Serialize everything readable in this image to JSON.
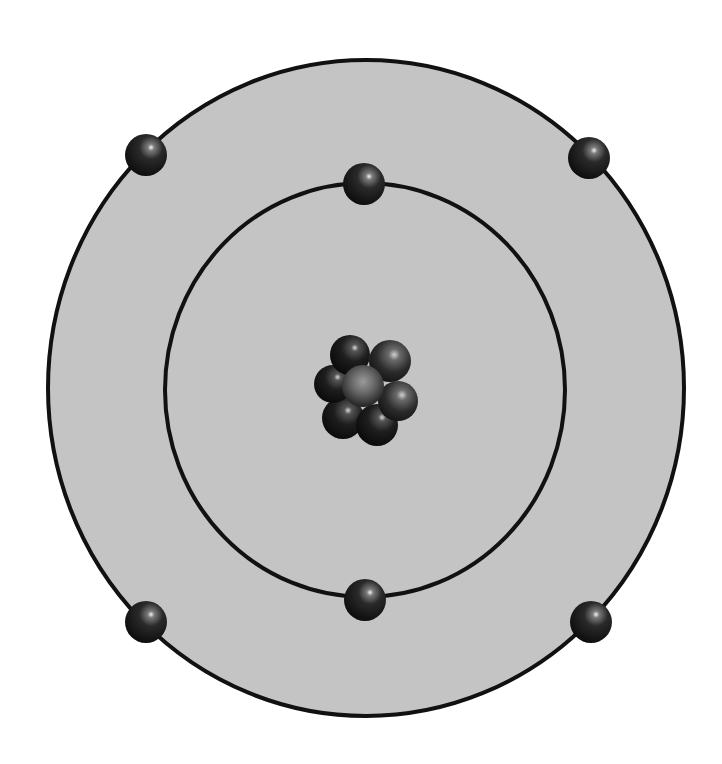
{
  "diagram": {
    "type": "atom-bohr-model",
    "colors": {
      "background": "#ffffff",
      "atom_fill": "#c4c4c4",
      "orbit_stroke": "#111111",
      "particle_dark": "#121212",
      "particle_mid": "#3a3a3a",
      "particle_highlight": "#e8e8e8"
    },
    "outer_boundary": {
      "cx": 366,
      "cy": 388,
      "rx": 318,
      "ry": 328,
      "stroke_width": 4
    },
    "orbits": [
      {
        "name": "inner-orbit",
        "cx": 365,
        "cy": 390,
        "rx": 200,
        "ry": 207,
        "stroke_width": 4
      }
    ],
    "electrons": [
      {
        "name": "electron-inner-top",
        "cx": 364,
        "cy": 184,
        "r": 21
      },
      {
        "name": "electron-inner-bottom",
        "cx": 365,
        "cy": 600,
        "r": 21
      },
      {
        "name": "electron-outer-top-left",
        "cx": 146,
        "cy": 155,
        "r": 21
      },
      {
        "name": "electron-outer-top-right",
        "cx": 589,
        "cy": 158,
        "r": 21
      },
      {
        "name": "electron-outer-bottom-left",
        "cx": 146,
        "cy": 622,
        "r": 21
      },
      {
        "name": "electron-outer-bottom-right",
        "cx": 591,
        "cy": 622,
        "r": 21
      }
    ],
    "nucleus": {
      "particle_count": 7,
      "particles": [
        {
          "cx": 343,
          "cy": 418,
          "r": 21,
          "tone": "dark"
        },
        {
          "cx": 377,
          "cy": 425,
          "r": 21,
          "tone": "dark"
        },
        {
          "cx": 333,
          "cy": 384,
          "r": 19,
          "tone": "dark"
        },
        {
          "cx": 398,
          "cy": 401,
          "r": 20,
          "tone": "mid"
        },
        {
          "cx": 350,
          "cy": 355,
          "r": 20,
          "tone": "dark"
        },
        {
          "cx": 390,
          "cy": 361,
          "r": 21,
          "tone": "mid"
        },
        {
          "cx": 363,
          "cy": 386,
          "r": 21,
          "tone": "light"
        }
      ]
    }
  }
}
